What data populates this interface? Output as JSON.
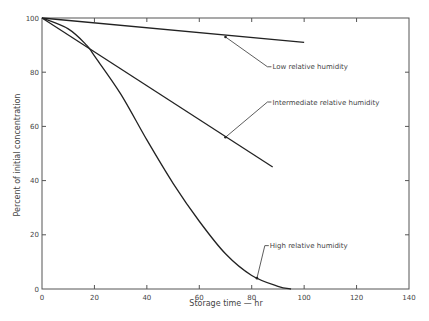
{
  "chart_data": {
    "type": "line",
    "title": "",
    "xlabel": "Storage time — hr",
    "ylabel": "Percent of initial concentration",
    "xlim": [
      0,
      140
    ],
    "ylim": [
      0,
      100
    ],
    "x_ticks": [
      0,
      20,
      40,
      60,
      80,
      100,
      120,
      140
    ],
    "y_ticks": [
      0,
      20,
      40,
      60,
      80,
      100
    ],
    "grid": false,
    "legend_position": "inline annotations",
    "series": [
      {
        "name": "Low relative humidity",
        "x": [
          0,
          100
        ],
        "y": [
          100,
          91
        ]
      },
      {
        "name": "Intermediate relative humidity",
        "x": [
          0,
          88
        ],
        "y": [
          100,
          45
        ]
      },
      {
        "name": "High relative humidity",
        "x": [
          0,
          10,
          17,
          20,
          30,
          40,
          50,
          60,
          70,
          80,
          90,
          95
        ],
        "y": [
          100,
          96,
          90,
          86,
          72,
          55,
          39,
          25,
          13,
          5,
          1,
          0
        ]
      }
    ],
    "annotations": [
      {
        "text": "Low relative humidity",
        "arrow_to": [
          70,
          93
        ],
        "label_at": [
          86,
          82
        ]
      },
      {
        "text": "Intermediate relative humidity",
        "arrow_to": [
          70,
          56
        ],
        "label_at": [
          86,
          69
        ]
      },
      {
        "text": "High relative humidity",
        "arrow_to": [
          82,
          4
        ],
        "label_at": [
          85,
          16
        ]
      }
    ]
  }
}
